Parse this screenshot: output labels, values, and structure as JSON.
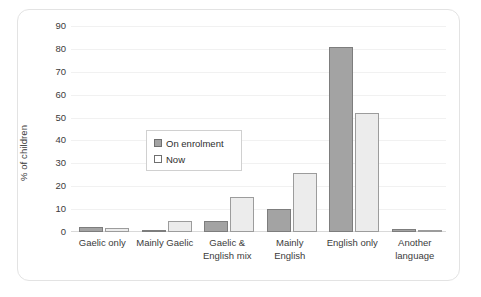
{
  "chart_data": {
    "type": "bar",
    "title": "",
    "xlabel": "",
    "ylabel": "% of children",
    "ylim": [
      0,
      90
    ],
    "yticks": [
      90,
      80,
      70,
      60,
      50,
      40,
      30,
      20,
      10,
      0
    ],
    "grid": true,
    "legend_position": "inside-center-left",
    "categories": [
      "Gaelic only",
      "Mainly Gaelic",
      "Gaelic & English mix",
      "Mainly English",
      "English only",
      "Another language"
    ],
    "category_lines": [
      [
        "Gaelic only"
      ],
      [
        "Mainly Gaelic"
      ],
      [
        "Gaelic &",
        "English mix"
      ],
      [
        "Mainly",
        "English"
      ],
      [
        "English only"
      ],
      [
        "Another",
        "language"
      ]
    ],
    "series": [
      {
        "name": "On enrolment",
        "color": "#a3a3a3",
        "border": "#7d7d7d",
        "values": [
          2,
          1,
          5,
          10,
          81,
          1.5
        ]
      },
      {
        "name": "Now",
        "color": "#ececec",
        "border": "#9c9c9c",
        "values": [
          1.8,
          4.7,
          15.5,
          26,
          52,
          0.6
        ]
      }
    ]
  },
  "colors": {
    "frame": "#e3e3e3",
    "grid": "#f1f1f1",
    "axis": "#d9d9d9",
    "text": "#3b3b3b",
    "background": "#ffffff"
  }
}
